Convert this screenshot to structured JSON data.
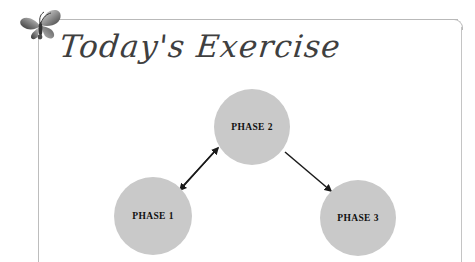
{
  "page": {
    "title": "Today's Exercise",
    "background_color": "#ffffff",
    "frame_color": "#bdbdbd"
  },
  "ornament": {
    "name": "butterfly-ornament",
    "icon": "butterfly-icon",
    "colors": [
      "#8a8a8a",
      "#4a4a4a",
      "#d8d8d8"
    ]
  },
  "diagram": {
    "type": "flow",
    "node_fill": "#c9c9c9",
    "arrow_color": "#1a1a1a",
    "nodes": [
      {
        "id": "phase1",
        "label": "PHASE 1",
        "cx": 153,
        "cy": 216,
        "r": 39
      },
      {
        "id": "phase2",
        "label": "PHASE 2",
        "cx": 252,
        "cy": 127,
        "r": 38
      },
      {
        "id": "phase3",
        "label": "PHASE 3",
        "cx": 358,
        "cy": 218,
        "r": 38
      }
    ],
    "connections": [
      {
        "from": "phase1",
        "to": "phase2",
        "style": "single-arrow"
      },
      {
        "from": "phase2",
        "to": "phase1",
        "style": "single-arrow"
      },
      {
        "from": "phase2",
        "to": "phase3",
        "style": "single-arrow"
      }
    ]
  }
}
